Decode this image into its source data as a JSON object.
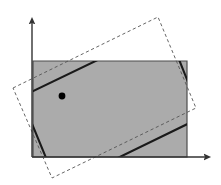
{
  "figure": {
    "title": "",
    "caption": "",
    "width": 221,
    "height": 185,
    "background_color": "#ffffff"
  },
  "colors": {
    "region_fill": "#ababab",
    "region_stroke": "#4d4d4d",
    "axis": "#333333",
    "solid_rect_stroke": "#1a1a1a",
    "dashed_rect_stroke": "#555555",
    "point_marker": "#000000"
  },
  "chart_data": {
    "type": "diagram",
    "title": "",
    "xlabel": "",
    "ylabel": "",
    "grid": false,
    "legend": null,
    "axes": {
      "origin": [
        32,
        157
      ],
      "x_axis": {
        "from": [
          32,
          157
        ],
        "to": [
          208,
          157
        ],
        "arrow": true,
        "label": ""
      },
      "y_axis": {
        "from": [
          32,
          157
        ],
        "to": [
          32,
          20
        ],
        "arrow": true,
        "label": ""
      },
      "tick_labels_x": [],
      "tick_labels_y": []
    },
    "shapes": [
      {
        "name": "gray-region",
        "type": "rectangle",
        "style": "filled",
        "points": [
          [
            33,
            61
          ],
          [
            187,
            61
          ],
          [
            187,
            157
          ],
          [
            33,
            157
          ]
        ]
      },
      {
        "name": "dashed-rotated-rectangle",
        "type": "rectangle",
        "style": "dashed",
        "points": [
          [
            13,
            88
          ],
          [
            158,
            17
          ],
          [
            196,
            108
          ],
          [
            52,
            178
          ]
        ]
      },
      {
        "name": "solid-rotated-rectangle",
        "type": "rectangle",
        "style": "solid-thick",
        "points": [
          [
            21,
            97
          ],
          [
            166,
            27
          ],
          [
            202,
            117
          ],
          [
            58,
            187
          ]
        ]
      }
    ],
    "markers": [
      {
        "name": "center-point",
        "x": 62,
        "y": 96,
        "radius": 3.4
      }
    ]
  }
}
